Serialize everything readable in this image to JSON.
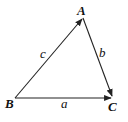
{
  "diagram": {
    "type": "vector-triangle",
    "stroke_color": "#222222",
    "vertices": [
      {
        "name": "A",
        "x": 83,
        "y": 18,
        "label": "A",
        "label_x": 77,
        "label_y": 15
      },
      {
        "name": "B",
        "x": 15,
        "y": 98,
        "label": "B",
        "label_x": 5,
        "label_y": 108
      },
      {
        "name": "C",
        "x": 113,
        "y": 98,
        "label": "C",
        "label_x": 108,
        "label_y": 111
      }
    ],
    "edges": [
      {
        "from": "B",
        "to": "A",
        "label": "c",
        "label_x": 40,
        "label_y": 58
      },
      {
        "from": "A",
        "to": "C",
        "label": "b",
        "label_x": 99,
        "label_y": 57
      },
      {
        "from": "B",
        "to": "C",
        "label": "a",
        "label_x": 61,
        "label_y": 108
      }
    ]
  }
}
